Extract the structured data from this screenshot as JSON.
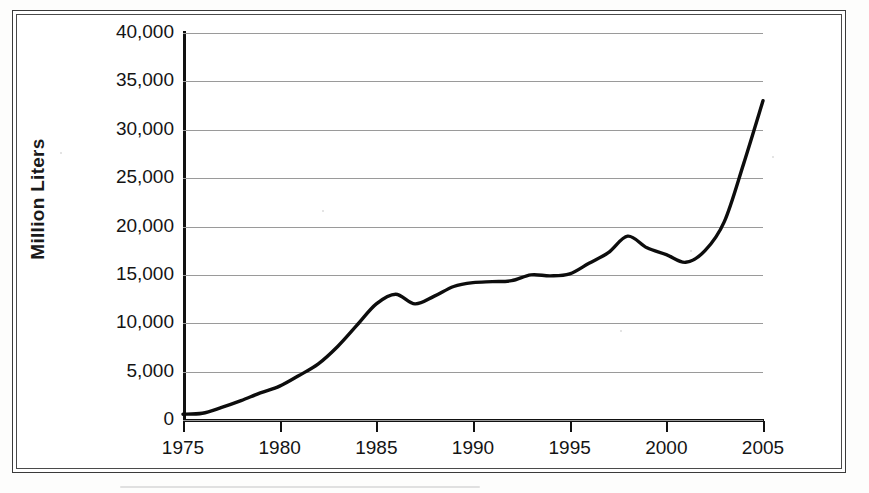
{
  "chart_data": {
    "type": "line",
    "title": "",
    "subtitle": "",
    "xlabel": "",
    "ylabel": "Million Liters",
    "xlim": [
      1975,
      2005
    ],
    "ylim": [
      0,
      40000
    ],
    "grid": true,
    "legend": false,
    "legend_position": "none",
    "y_ticks": [
      0,
      5000,
      10000,
      15000,
      20000,
      25000,
      30000,
      35000,
      40000
    ],
    "y_tick_labels": [
      "0",
      "5,000",
      "10,000",
      "15,000",
      "20,000",
      "25,000",
      "30,000",
      "35,000",
      "40,000"
    ],
    "x_ticks": [
      1975,
      1980,
      1985,
      1990,
      1995,
      2000,
      2005
    ],
    "x_tick_labels": [
      "1975",
      "1980",
      "1985",
      "1990",
      "1995",
      "2000",
      "2005"
    ],
    "x": [
      1975,
      1976,
      1977,
      1978,
      1979,
      1980,
      1981,
      1982,
      1983,
      1984,
      1985,
      1986,
      1987,
      1988,
      1989,
      1990,
      1991,
      1992,
      1993,
      1994,
      1995,
      1996,
      1997,
      1998,
      1999,
      2000,
      2001,
      2002,
      2003,
      2004,
      2005
    ],
    "values": [
      600,
      700,
      1300,
      2000,
      2800,
      3500,
      4600,
      5800,
      7600,
      9800,
      12000,
      13000,
      12000,
      12800,
      13800,
      14200,
      14300,
      14400,
      15000,
      14900,
      15100,
      16200,
      17300,
      19000,
      17800,
      17100,
      16300,
      17500,
      20500,
      26500,
      33000
    ],
    "series_color": "#0d0d0d",
    "series_name": "",
    "annotations": []
  },
  "axis": {
    "y_title": "Million Liters"
  }
}
